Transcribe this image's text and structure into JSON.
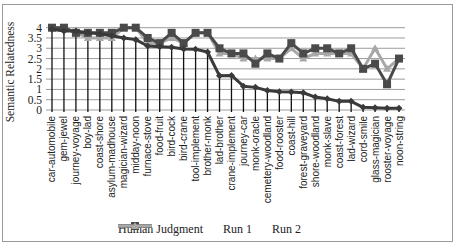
{
  "chart_data": {
    "type": "line",
    "title": "",
    "xlabel": "",
    "ylabel": "Semantic Relatedness",
    "ylim": [
      0,
      4
    ],
    "yticks": [
      "0",
      "0.5",
      "1",
      "1.5",
      "2",
      "2.5",
      "3",
      "3.5",
      "4"
    ],
    "grid": true,
    "legend_position": "bottom",
    "categories": [
      "car-automobile",
      "gem-jewel",
      "journey-voyage",
      "boy-lad",
      "coast-shore",
      "asylum-madhouse",
      "magician-wizard",
      "midday-noon",
      "furnace-stove",
      "food-fruit",
      "bird-cock",
      "bird-crane",
      "tool-implement",
      "brother-monk",
      "lad-brother",
      "crane-implement",
      "journey-car",
      "monk-oracle",
      "cemetery-woodland",
      "food-rooster",
      "coast-hill",
      "forest-graveyard",
      "shore-woodland",
      "monk-slave",
      "coast-forest",
      "lad-wizard",
      "cord-smile",
      "glass-magician",
      "rooster-voyage",
      "noon-string"
    ],
    "series": [
      {
        "name": "Human Judgment",
        "color": "#3a3a3a",
        "marker": "diamond",
        "values": [
          3.92,
          3.84,
          3.84,
          3.76,
          3.7,
          3.61,
          3.5,
          3.42,
          3.11,
          3.08,
          3.05,
          2.97,
          2.95,
          2.82,
          1.66,
          1.68,
          1.16,
          1.1,
          0.95,
          0.89,
          0.87,
          0.84,
          0.63,
          0.55,
          0.42,
          0.42,
          0.13,
          0.11,
          0.08,
          0.08
        ]
      },
      {
        "name": "Run 1",
        "color": "#4a4a4a",
        "marker": "square",
        "values": [
          4.0,
          4.0,
          3.75,
          3.75,
          3.75,
          3.75,
          4.0,
          4.0,
          3.5,
          3.25,
          3.75,
          3.25,
          3.75,
          3.75,
          3.0,
          2.75,
          2.75,
          2.25,
          2.75,
          2.5,
          3.25,
          2.75,
          3.0,
          3.0,
          2.75,
          3.0,
          2.0,
          2.25,
          1.25,
          2.5
        ]
      },
      {
        "name": "Run 2",
        "color": "#a8a8a8",
        "marker": "triangle",
        "values": [
          4.0,
          4.0,
          3.75,
          3.5,
          3.5,
          3.5,
          4.0,
          4.0,
          3.25,
          3.25,
          3.5,
          3.25,
          3.75,
          3.75,
          2.75,
          2.75,
          2.5,
          2.5,
          2.5,
          2.5,
          3.0,
          2.5,
          2.75,
          2.75,
          2.75,
          2.75,
          2.0,
          3.0,
          2.0,
          2.5
        ]
      }
    ]
  }
}
